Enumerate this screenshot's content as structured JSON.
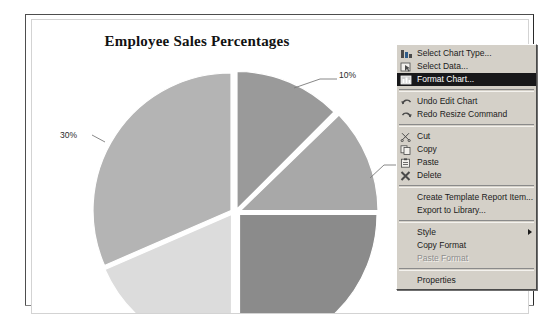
{
  "report": {
    "title": "Employee Sales Percentages"
  },
  "chart_data": {
    "type": "pie",
    "title": "Employee Sales Percentages",
    "categories": [
      "Slice A",
      "Slice B",
      "Slice C",
      "Slice D",
      "Slice E"
    ],
    "values": [
      10,
      15,
      25,
      20,
      30
    ],
    "labels": [
      "10%",
      "1",
      "",
      "",
      "30%"
    ],
    "visible_labels": [
      {
        "text": "10%",
        "x": 308,
        "y": 55
      },
      {
        "text": "1",
        "x": 392,
        "y": 142
      },
      {
        "text": "30%",
        "x": 50,
        "y": 116
      }
    ],
    "exploded": true,
    "legend": "none",
    "grid": false,
    "colors": [
      "#9a9a9a",
      "#a8a8a8",
      "#8b8b8b",
      "#dcdcdc",
      "#b4b4b4"
    ]
  },
  "context_menu": {
    "items": [
      {
        "label": "Select Chart Type...",
        "icon": "chart-type-icon",
        "state": "normal",
        "submenu": false
      },
      {
        "label": "Select Data...",
        "icon": "select-data-icon",
        "state": "normal",
        "submenu": false
      },
      {
        "label": "Format Chart...",
        "icon": "format-chart-icon",
        "state": "selected",
        "submenu": false
      },
      {
        "separator": true
      },
      {
        "label": "Undo Edit Chart",
        "icon": "undo-icon",
        "state": "normal",
        "submenu": false
      },
      {
        "label": "Redo Resize Command",
        "icon": "redo-icon",
        "state": "normal",
        "submenu": false
      },
      {
        "separator": true
      },
      {
        "label": "Cut",
        "icon": "scissors-icon",
        "state": "normal",
        "submenu": false
      },
      {
        "label": "Copy",
        "icon": "copy-icon",
        "state": "normal",
        "submenu": false
      },
      {
        "label": "Paste",
        "icon": "paste-icon",
        "state": "normal",
        "submenu": false
      },
      {
        "label": "Delete",
        "icon": "delete-icon",
        "state": "normal",
        "submenu": false
      },
      {
        "separator": true
      },
      {
        "label": "Create Template Report Item...",
        "icon": "none",
        "state": "normal",
        "submenu": false
      },
      {
        "label": "Export to Library...",
        "icon": "none",
        "state": "normal",
        "submenu": false
      },
      {
        "separator": true
      },
      {
        "label": "Style",
        "icon": "none",
        "state": "normal",
        "submenu": true
      },
      {
        "label": "Copy Format",
        "icon": "none",
        "state": "normal",
        "submenu": false
      },
      {
        "label": "Paste Format",
        "icon": "none",
        "state": "disabled",
        "submenu": false
      },
      {
        "separator": true
      },
      {
        "label": "Properties",
        "icon": "none",
        "state": "normal",
        "submenu": false
      }
    ]
  },
  "colors": {
    "menu_face": "#d4d0c8",
    "menu_highlight": "#18181a",
    "page_background": "#ffffff",
    "gutter": "#bfbfbf"
  }
}
